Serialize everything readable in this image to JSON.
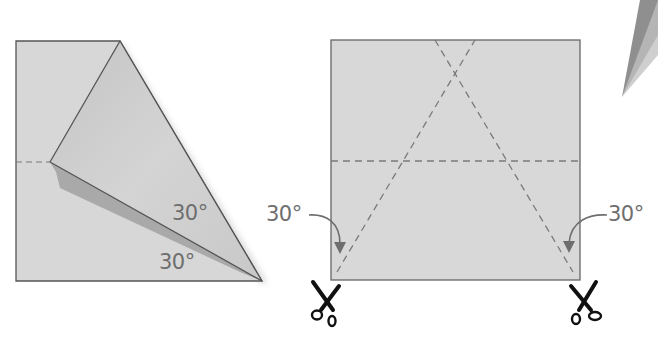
{
  "figure_left": {
    "angle_label_upper": "30°",
    "angle_label_lower": "30°"
  },
  "figure_right": {
    "angle_label_left": "30°",
    "angle_label_right": "30°",
    "cut_markers": [
      "scissors-left",
      "scissors-right"
    ]
  },
  "colors": {
    "paper": "#d6d6d6",
    "paper_folded": "#d2d2d2",
    "shadow": "#a9a9a9",
    "outline": "#555555",
    "dash": "#7a7a7a",
    "label": "#6e6e6e",
    "scissors": "#111111"
  }
}
